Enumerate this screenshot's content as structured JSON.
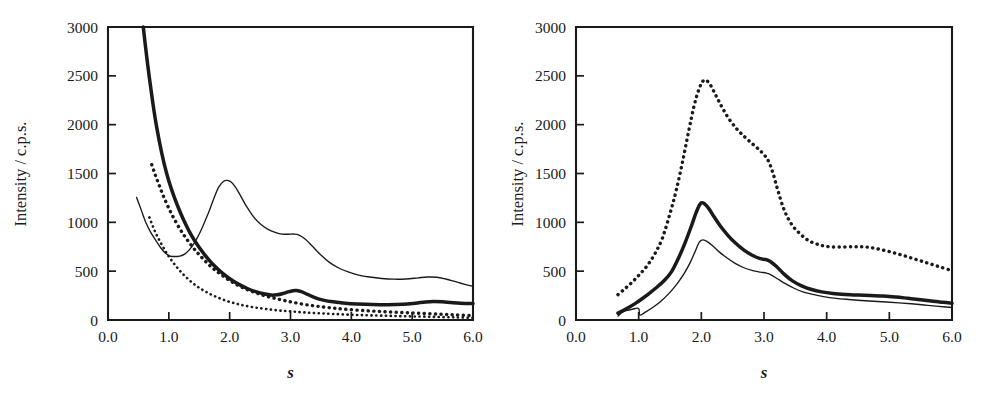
{
  "figure": {
    "background_color": "#ffffff",
    "ink_color": "#1a1a1a",
    "panel_count": 2
  },
  "chart_data": [
    {
      "type": "line",
      "panel": "left",
      "title": "",
      "xlabel": "s",
      "ylabel": "Intensity / c.p.s.",
      "xlim": [
        0.0,
        6.0
      ],
      "ylim": [
        0,
        3000
      ],
      "xticks": [
        "0.0",
        "1.0",
        "2.0",
        "3.0",
        "4.0",
        "5.0",
        "6.0"
      ],
      "xtick_values": [
        0.0,
        1.0,
        2.0,
        3.0,
        4.0,
        5.0,
        6.0
      ],
      "yticks": [
        "0",
        "500",
        "1000",
        "1500",
        "2000",
        "2500",
        "3000"
      ],
      "ytick_values": [
        0,
        500,
        1000,
        1500,
        2000,
        2500,
        3000
      ],
      "grid": false,
      "legend": "none",
      "series": [
        {
          "name": "thin-solid-curve",
          "style": "thin solid",
          "x": [
            0.47,
            0.55,
            0.62,
            0.7,
            0.78,
            0.86,
            0.95,
            1.02,
            1.1,
            1.18,
            1.26,
            1.34,
            1.42,
            1.5,
            1.58,
            1.66,
            1.74,
            1.82,
            1.9,
            1.96,
            2.02,
            2.1,
            2.18,
            2.28,
            2.4,
            2.52,
            2.64,
            2.76,
            2.86,
            2.96,
            3.06,
            3.14,
            3.24,
            3.36,
            3.5,
            3.64,
            3.8,
            3.96,
            4.12,
            4.3,
            4.5,
            4.7,
            4.9,
            5.1,
            5.25,
            5.4,
            5.55,
            5.7,
            5.85,
            6.0
          ],
          "y": [
            1255,
            1120,
            1000,
            900,
            820,
            745,
            680,
            655,
            650,
            655,
            675,
            720,
            790,
            880,
            990,
            1110,
            1245,
            1360,
            1420,
            1430,
            1415,
            1355,
            1270,
            1160,
            1050,
            975,
            925,
            895,
            880,
            878,
            880,
            870,
            830,
            755,
            665,
            590,
            530,
            490,
            460,
            440,
            425,
            418,
            420,
            432,
            440,
            438,
            420,
            395,
            368,
            345
          ]
        },
        {
          "name": "thick-solid-curve",
          "style": "thick solid",
          "x": [
            0.58,
            0.62,
            0.68,
            0.74,
            0.8,
            0.88,
            0.96,
            1.04,
            1.14,
            1.24,
            1.36,
            1.48,
            1.6,
            1.74,
            1.88,
            2.02,
            2.16,
            2.3,
            2.44,
            2.56,
            2.68,
            2.78,
            2.88,
            2.96,
            3.04,
            3.1,
            3.18,
            3.28,
            3.4,
            3.54,
            3.7,
            3.9,
            4.1,
            4.35,
            4.6,
            4.85,
            5.05,
            5.22,
            5.35,
            5.5,
            5.65,
            5.8,
            6.0
          ],
          "y": [
            3000,
            2780,
            2480,
            2210,
            1975,
            1720,
            1510,
            1345,
            1175,
            1030,
            880,
            760,
            660,
            560,
            480,
            415,
            362,
            320,
            288,
            268,
            255,
            258,
            272,
            288,
            300,
            302,
            290,
            262,
            230,
            204,
            186,
            172,
            164,
            158,
            156,
            160,
            172,
            185,
            190,
            186,
            178,
            172,
            168
          ]
        },
        {
          "name": "coarse-dotted-curve",
          "style": "coarse dotted",
          "x": [
            0.72,
            0.78,
            0.85,
            0.92,
            1.0,
            1.08,
            1.18,
            1.28,
            1.4,
            1.52,
            1.66,
            1.8,
            1.95,
            2.1,
            2.25,
            2.4,
            2.56,
            2.72,
            2.88,
            3.05,
            3.25,
            3.45,
            3.7,
            3.95,
            4.25,
            4.55,
            4.85,
            5.15,
            5.45,
            5.72,
            6.0
          ],
          "y": [
            1590,
            1480,
            1365,
            1255,
            1145,
            1045,
            935,
            840,
            740,
            655,
            565,
            492,
            425,
            368,
            322,
            285,
            252,
            225,
            202,
            180,
            157,
            140,
            122,
            108,
            95,
            85,
            76,
            68,
            60,
            52,
            45
          ]
        },
        {
          "name": "fine-dotted-curve",
          "style": "fine dotted",
          "x": [
            0.68,
            0.74,
            0.8,
            0.88,
            0.96,
            1.04,
            1.14,
            1.24,
            1.36,
            1.48,
            1.62,
            1.76,
            1.92,
            2.08,
            2.24,
            2.42,
            2.6,
            2.8,
            3.0,
            3.22,
            3.45,
            3.7,
            4.0,
            4.3,
            4.65,
            5.0,
            5.35,
            5.7,
            6.0
          ],
          "y": [
            1050,
            955,
            870,
            775,
            690,
            615,
            535,
            465,
            395,
            338,
            285,
            242,
            202,
            172,
            148,
            128,
            112,
            98,
            88,
            78,
            70,
            62,
            54,
            48,
            42,
            37,
            32,
            27,
            22
          ]
        }
      ]
    },
    {
      "type": "line",
      "panel": "right",
      "title": "",
      "xlabel": "s",
      "ylabel": "Intensity / c.p.s.",
      "xlim": [
        0.0,
        6.0
      ],
      "ylim": [
        0,
        3000
      ],
      "xticks": [
        "0.0",
        "1.0",
        "2.0",
        "3.0",
        "4.0",
        "5.0",
        "6.0"
      ],
      "xtick_values": [
        0.0,
        1.0,
        2.0,
        3.0,
        4.0,
        5.0,
        6.0
      ],
      "yticks": [
        "0",
        "500",
        "1000",
        "1500",
        "2000",
        "2500",
        "3000"
      ],
      "ytick_values": [
        0,
        500,
        1000,
        1500,
        2000,
        2500,
        3000
      ],
      "grid": false,
      "legend": "none",
      "series": [
        {
          "name": "dotted-curve",
          "style": "coarse dotted",
          "x": [
            0.67,
            0.78,
            0.9,
            1.02,
            1.14,
            1.26,
            1.38,
            1.5,
            1.6,
            1.7,
            1.8,
            1.88,
            1.96,
            2.04,
            2.12,
            2.2,
            2.3,
            2.42,
            2.56,
            2.7,
            2.84,
            2.96,
            3.06,
            3.14,
            3.22,
            3.32,
            3.44,
            3.58,
            3.72,
            3.88,
            4.05,
            4.25,
            4.45,
            4.62,
            4.8,
            5.0,
            5.2,
            5.4,
            5.6,
            5.8,
            6.0
          ],
          "y": [
            260,
            320,
            390,
            470,
            560,
            680,
            840,
            1090,
            1330,
            1620,
            1940,
            2180,
            2360,
            2455,
            2430,
            2340,
            2215,
            2080,
            1960,
            1870,
            1790,
            1720,
            1640,
            1510,
            1330,
            1130,
            980,
            880,
            810,
            770,
            750,
            748,
            750,
            748,
            730,
            700,
            665,
            625,
            585,
            545,
            505
          ]
        },
        {
          "name": "thick-solid-curve",
          "style": "thick solid",
          "x": [
            0.67,
            0.76,
            0.86,
            0.96,
            1.06,
            1.16,
            1.28,
            1.4,
            1.52,
            1.64,
            1.74,
            1.84,
            1.92,
            1.99,
            2.05,
            2.12,
            2.2,
            2.3,
            2.42,
            2.54,
            2.68,
            2.82,
            2.94,
            3.02,
            3.1,
            3.2,
            3.32,
            3.46,
            3.6,
            3.76,
            3.92,
            4.1,
            4.3,
            4.5,
            4.7,
            4.9,
            5.1,
            5.3,
            5.5,
            5.7,
            5.85,
            6.0
          ],
          "y": [
            70,
            100,
            135,
            175,
            220,
            268,
            330,
            400,
            490,
            640,
            790,
            960,
            1105,
            1195,
            1190,
            1140,
            1060,
            965,
            870,
            790,
            715,
            660,
            628,
            620,
            600,
            548,
            470,
            398,
            350,
            312,
            288,
            272,
            262,
            256,
            252,
            246,
            236,
            222,
            208,
            192,
            182,
            172
          ]
        },
        {
          "name": "thin-solid-curve",
          "style": "thin solid",
          "x": [
            0.67,
            0.72,
            0.8,
            0.9,
            1.0,
            1.02,
            1.12,
            1.24,
            1.36,
            1.48,
            1.6,
            1.72,
            1.82,
            1.9,
            1.97,
            2.03,
            2.1,
            2.18,
            2.28,
            2.4,
            2.54,
            2.68,
            2.82,
            2.94,
            3.04,
            3.12,
            3.22,
            3.34,
            3.48,
            3.62,
            3.78,
            3.95,
            4.15,
            4.35,
            4.55,
            4.75,
            4.95,
            5.15,
            5.35,
            5.55,
            5.75,
            6.0
          ],
          "y": [
            40,
            70,
            95,
            110,
            118,
            50,
            85,
            135,
            195,
            270,
            360,
            470,
            585,
            700,
            800,
            820,
            800,
            760,
            700,
            640,
            580,
            535,
            505,
            490,
            480,
            460,
            420,
            372,
            325,
            288,
            262,
            240,
            222,
            210,
            200,
            192,
            184,
            176,
            166,
            154,
            142,
            128
          ]
        }
      ]
    }
  ]
}
